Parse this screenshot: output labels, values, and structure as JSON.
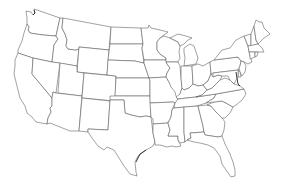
{
  "map": {
    "title": "",
    "type": "outline",
    "region": "Contiguous United States",
    "labels_visible": false,
    "colors": {
      "background": "#ffffff",
      "fill": "#ffffff",
      "border": "#555555"
    },
    "states": [
      {
        "id": "WA",
        "name": "Washington"
      },
      {
        "id": "OR",
        "name": "Oregon"
      },
      {
        "id": "CA",
        "name": "California"
      },
      {
        "id": "ID",
        "name": "Idaho"
      },
      {
        "id": "NV",
        "name": "Nevada"
      },
      {
        "id": "MT",
        "name": "Montana"
      },
      {
        "id": "WY",
        "name": "Wyoming"
      },
      {
        "id": "UT",
        "name": "Utah"
      },
      {
        "id": "AZ",
        "name": "Arizona"
      },
      {
        "id": "CO",
        "name": "Colorado"
      },
      {
        "id": "NM",
        "name": "New Mexico"
      },
      {
        "id": "ND",
        "name": "North Dakota"
      },
      {
        "id": "SD",
        "name": "South Dakota"
      },
      {
        "id": "NE",
        "name": "Nebraska"
      },
      {
        "id": "KS",
        "name": "Kansas"
      },
      {
        "id": "OK",
        "name": "Oklahoma"
      },
      {
        "id": "TX",
        "name": "Texas"
      },
      {
        "id": "MN",
        "name": "Minnesota"
      },
      {
        "id": "IA",
        "name": "Iowa"
      },
      {
        "id": "MO",
        "name": "Missouri"
      },
      {
        "id": "AR",
        "name": "Arkansas"
      },
      {
        "id": "LA",
        "name": "Louisiana"
      },
      {
        "id": "WI",
        "name": "Wisconsin"
      },
      {
        "id": "IL",
        "name": "Illinois"
      },
      {
        "id": "MI",
        "name": "Michigan"
      },
      {
        "id": "IN",
        "name": "Indiana"
      },
      {
        "id": "OH",
        "name": "Ohio"
      },
      {
        "id": "KY",
        "name": "Kentucky"
      },
      {
        "id": "TN",
        "name": "Tennessee"
      },
      {
        "id": "MS",
        "name": "Mississippi"
      },
      {
        "id": "AL",
        "name": "Alabama"
      },
      {
        "id": "GA",
        "name": "Georgia"
      },
      {
        "id": "FL",
        "name": "Florida"
      },
      {
        "id": "SC",
        "name": "South Carolina"
      },
      {
        "id": "NC",
        "name": "North Carolina"
      },
      {
        "id": "VA",
        "name": "Virginia"
      },
      {
        "id": "WV",
        "name": "West Virginia"
      },
      {
        "id": "PA",
        "name": "Pennsylvania"
      },
      {
        "id": "NY",
        "name": "New York"
      },
      {
        "id": "VT",
        "name": "Vermont"
      },
      {
        "id": "NH",
        "name": "New Hampshire"
      },
      {
        "id": "ME",
        "name": "Maine"
      },
      {
        "id": "MA",
        "name": "Massachusetts"
      },
      {
        "id": "CT",
        "name": "Connecticut"
      },
      {
        "id": "RI",
        "name": "Rhode Island"
      },
      {
        "id": "NJ",
        "name": "New Jersey"
      },
      {
        "id": "DE",
        "name": "Delaware"
      },
      {
        "id": "MD",
        "name": "Maryland"
      }
    ]
  }
}
